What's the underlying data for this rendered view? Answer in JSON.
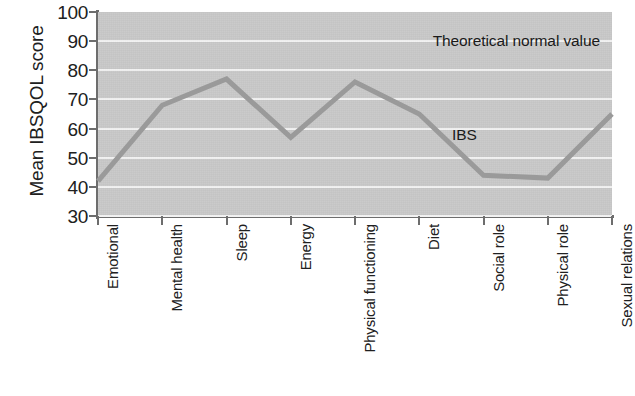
{
  "chart_data": {
    "type": "line",
    "title": "",
    "xlabel": "",
    "ylabel": "Mean IBSQOL score",
    "ylim": [
      30,
      100
    ],
    "yticks": [
      100,
      90,
      80,
      70,
      60,
      50,
      40,
      30
    ],
    "grid": true,
    "legend": "none",
    "categories": [
      "Emotional",
      "Mental health",
      "Sleep",
      "Energy",
      "Physical functioning",
      "Diet",
      "Social role",
      "Physical role",
      "Sexual relations"
    ],
    "series": [
      {
        "name": "IBS",
        "values": [
          42,
          68,
          77,
          57,
          76,
          65,
          44,
          43,
          65
        ],
        "color": "#9a9a9a"
      }
    ],
    "annotations": [
      {
        "text": "Theoretical normal value",
        "value": 100
      },
      {
        "text": "IBS",
        "value": 58
      }
    ],
    "colors": {
      "plot_background": "#c9c9c9",
      "gridline": "#f2f2f2",
      "axis": "#6d6d6d",
      "series": "#9a9a9a",
      "text": "#1a1a1a"
    }
  }
}
